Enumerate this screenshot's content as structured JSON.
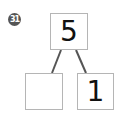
{
  "problem": {
    "number_badge": "31",
    "top_value": "5",
    "bottom_left_value": "",
    "bottom_right_value": "1"
  },
  "colors": {
    "badge_bg": "#555555",
    "box_border": "#b5b5b5",
    "line": "#555555"
  }
}
